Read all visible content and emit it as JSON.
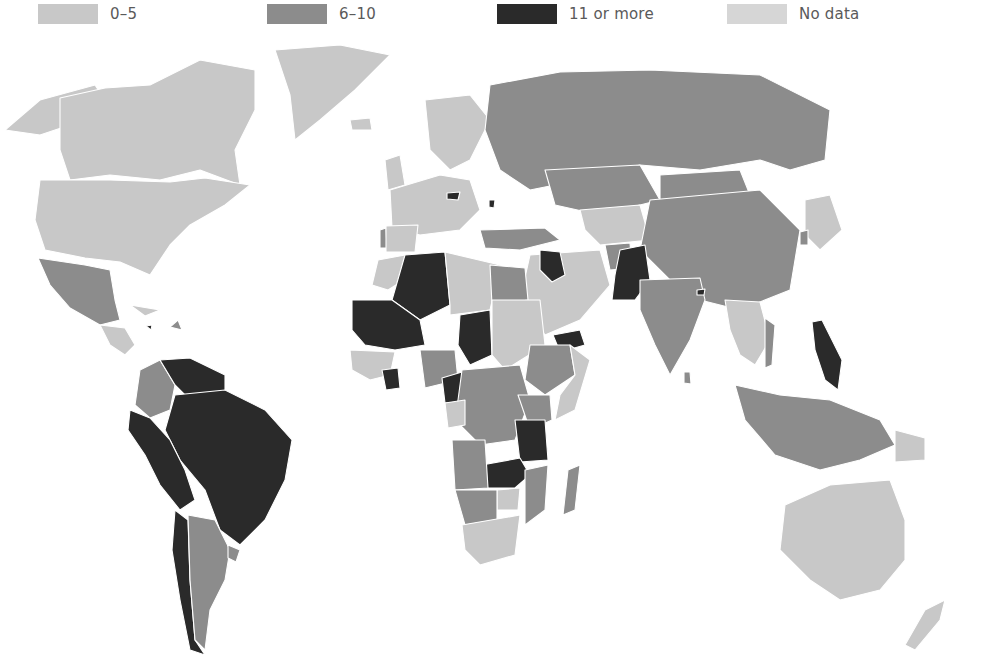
{
  "map": {
    "type": "choropleth",
    "projection": "world (Robinson-like)",
    "title": "",
    "colors": {
      "bin_0_5": "#c8c8c8",
      "bin_6_10": "#8c8c8c",
      "bin_11_plus": "#2a2a2a",
      "no_data": "#d6d6d6",
      "border": "#ffffff",
      "ocean": "#ffffff"
    }
  },
  "legend": {
    "items": [
      {
        "label": "0–5",
        "color": "#c8c8c8"
      },
      {
        "label": "6–10",
        "color": "#8c8c8c"
      },
      {
        "label": "11 or more",
        "color": "#2a2a2a"
      },
      {
        "label": "No data",
        "color": "#d6d6d6"
      }
    ]
  },
  "regions": {
    "north_america": {
      "canada": "0–5",
      "usa": "0–5",
      "greenland": "0–5",
      "mexico": "6–10"
    },
    "central_america_caribbean": {
      "guatemala": "0–5",
      "honduras": "6–10",
      "nicaragua": "0–5",
      "panama": "6–10",
      "cuba": "0–5",
      "haiti": "11 or more",
      "dominican_republic": "6–10"
    },
    "south_america": {
      "colombia": "6–10",
      "venezuela": "11 or more",
      "guyana": "11 or more",
      "suriname": "11 or more",
      "french_guiana": "0–5",
      "ecuador": "11 or more",
      "peru": "11 or more",
      "brazil": "11 or more",
      "bolivia": "11 or more",
      "paraguay": "11 or more",
      "chile": "11 or more",
      "argentina": "6–10",
      "uruguay": "6–10"
    },
    "europe": {
      "most": "0–5",
      "portugal": "6–10",
      "czechia": "11 or more",
      "moldova": "11 or more",
      "greece": "6–10",
      "turkey": "6–10",
      "russia": "6–10"
    },
    "africa": {
      "morocco": "0–5",
      "algeria": "11 or more",
      "mauritania": "11 or more",
      "mali": "11 or more",
      "niger": "0–5",
      "chad": "11 or more",
      "libya": "0–5",
      "egypt": "6–10",
      "sudan": "0–5",
      "ethiopia": "6–10",
      "somalia": "0–5",
      "nigeria": "6–10",
      "cote_divoire": "11 or more",
      "cameroon": "11 or more",
      "car": "6–10",
      "drc": "6–10",
      "tanzania": "11 or more",
      "zambia": "11 or more",
      "malawi": "11 or more",
      "angola": "6–10",
      "namibia": "6–10",
      "botswana": "6–10",
      "zimbabwe": "0–5",
      "mozambique": "6–10",
      "south_africa": "0–5",
      "madagascar": "6–10"
    },
    "middle_east_asia": {
      "iraq": "11 or more",
      "iran": "0–5",
      "saudi_arabia": "0–5",
      "yemen": "11 or more",
      "afghanistan": "6–10",
      "pakistan": "11 or more",
      "india": "6–10",
      "nepal": "11 or more",
      "kazakhstan": "6–10",
      "mongolia": "6–10",
      "china": "6–10",
      "japan": "0–5",
      "south_korea": "6–10",
      "north_korea": "0–5",
      "myanmar": "0–5",
      "thailand": "0–5",
      "vietnam": "6–10",
      "philippines": "11 or more",
      "indonesia": "6–10",
      "malaysia": "6–10",
      "papua_new_guinea": "0–5"
    },
    "oceania": {
      "australia": "0–5",
      "new_zealand": "0–5"
    }
  }
}
